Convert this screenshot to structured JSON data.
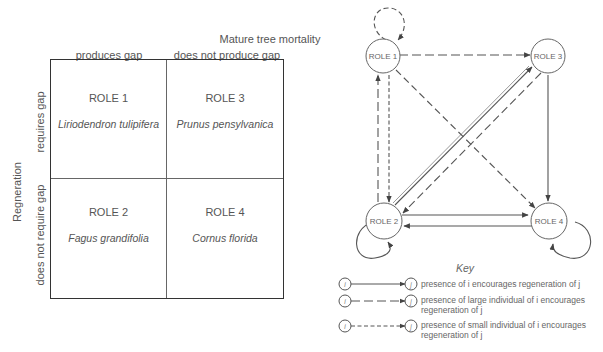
{
  "matrix": {
    "column_axis_title": "Mature tree mortality",
    "columns": [
      "produces gap",
      "does not produce gap"
    ],
    "row_axis_title": "Regneration",
    "rows": [
      "requires gap",
      "does not require gap"
    ],
    "cells": [
      {
        "role": "ROLE 1",
        "species": "Liriodendron tulipifera",
        "row": "requires gap",
        "column": "produces gap"
      },
      {
        "role": "ROLE 3",
        "species": "Prunus pensylvanica",
        "row": "requires gap",
        "column": "does not produce gap"
      },
      {
        "role": "ROLE 2",
        "species": "Fagus grandifolia",
        "row": "does not require gap",
        "column": "produces gap"
      },
      {
        "role": "ROLE 4",
        "species": "Cornus florida",
        "row": "does not require gap",
        "column": "does not produce gap"
      }
    ]
  },
  "network": {
    "nodes": [
      {
        "id": "role1",
        "label": "ROLE 1"
      },
      {
        "id": "role2",
        "label": "ROLE 2"
      },
      {
        "id": "role3",
        "label": "ROLE 3"
      },
      {
        "id": "role4",
        "label": "ROLE 4"
      }
    ],
    "edges": [
      {
        "from": "role1",
        "to": "role1",
        "style": "large-dashed"
      },
      {
        "from": "role1",
        "to": "role3",
        "style": "large-dashed"
      },
      {
        "from": "role1",
        "to": "role4",
        "style": "large-dashed"
      },
      {
        "from": "role1",
        "to": "role2",
        "style": "small-dashed"
      },
      {
        "from": "role2",
        "to": "role1",
        "style": "large-dashed"
      },
      {
        "from": "role2",
        "to": "role3",
        "style": "solid"
      },
      {
        "from": "role3",
        "to": "role2",
        "style": "large-dashed"
      },
      {
        "from": "role3",
        "to": "role4",
        "style": "solid"
      },
      {
        "from": "role2",
        "to": "role4",
        "style": "solid"
      },
      {
        "from": "role4",
        "to": "role2",
        "style": "solid"
      },
      {
        "from": "role2",
        "to": "role2",
        "style": "solid"
      },
      {
        "from": "role4",
        "to": "role4",
        "style": "solid"
      }
    ]
  },
  "key": {
    "title": "Key",
    "node_i": "i",
    "node_j": "j",
    "items": [
      {
        "style": "solid",
        "text": "presence of i encourages regeneration of j"
      },
      {
        "style": "large-dashed",
        "text": "presence of large individual of i encourages regeneration of j"
      },
      {
        "style": "small-dashed",
        "text": "presence of small individual of i encourages regeneration of j"
      }
    ]
  },
  "colors": {
    "line": "#444444",
    "text": "#555555",
    "background": "#ffffff"
  }
}
